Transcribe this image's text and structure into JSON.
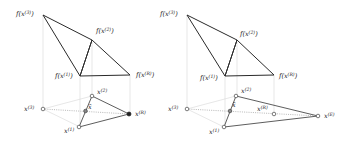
{
  "figure": {
    "panels": [
      {
        "id": "reflection",
        "labels": {
          "f_x3": "f(x",
          "f_x3_sup": "(3)",
          "f_x2": "f(x",
          "f_x2_sup": "(2)",
          "f_x1": "f(x",
          "f_x1_sup": "(1)",
          "f_xR": "f(x",
          "f_xR_sup": "(R)",
          "x3": "x",
          "x3_sup": "(3)",
          "x2": "x",
          "x2_sup": "(2)",
          "x1": "x",
          "x1_sup": "(1)",
          "xR": "x",
          "xR_sup": "(R)",
          "xbar": "x̄",
          "close_paren": ")"
        },
        "fill_colors": {
          "old_face": "#c8c8c8",
          "new_face": "#ffffff"
        }
      },
      {
        "id": "expansion",
        "labels": {
          "f_x3": "f(x",
          "f_x3_sup": "(3)",
          "f_x2": "f(x",
          "f_x2_sup": "(2)",
          "f_x1": "f(x",
          "f_x1_sup": "(1)",
          "f_xR": "f(x",
          "f_xR_sup": "(R)",
          "x3": "x",
          "x3_sup": "(3)",
          "x2": "x",
          "x2_sup": "(2)",
          "x1": "x",
          "x1_sup": "(1)",
          "xR": "x",
          "xR_sup": "(R)",
          "xE": "x",
          "xE_sup": "(E)",
          "xbar": "x̄",
          "close_paren": ")"
        },
        "fill_colors": {
          "old_face": "#c8c8c8",
          "new_face": "#8a8a8a"
        }
      }
    ]
  }
}
